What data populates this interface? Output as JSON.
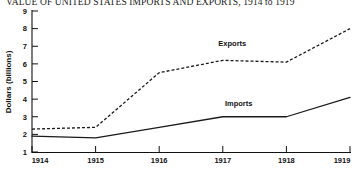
{
  "chart_data": {
    "type": "line",
    "title": "VALUE OF UNITED STATES IMPORTS AND EXPORTS, 1914 to 1919",
    "xlabel": "",
    "ylabel": "Dollars (billions)",
    "x": [
      1914,
      1915,
      1916,
      1917,
      1918,
      1919
    ],
    "x_tick_labels": [
      "1914",
      "1915",
      "1916",
      "1917",
      "1918",
      "1919"
    ],
    "y_tick_labels": [
      "1",
      "2",
      "3",
      "4",
      "5",
      "6",
      "7",
      "8",
      "9"
    ],
    "y_ticks": [
      1,
      2,
      3,
      4,
      5,
      6,
      7,
      8,
      9
    ],
    "xlim": [
      1914,
      1919
    ],
    "ylim": [
      1,
      9
    ],
    "grid": false,
    "legend": "inline-labels",
    "series": [
      {
        "name": "Exports",
        "style": "dashed",
        "color": "#1a1a1a",
        "values": [
          2.3,
          2.4,
          5.5,
          6.2,
          6.1,
          8.0
        ],
        "label_x": 1917.15,
        "label_y": 7.0
      },
      {
        "name": "Imports",
        "style": "solid",
        "color": "#1a1a1a",
        "values": [
          1.9,
          1.8,
          2.4,
          3.0,
          3.0,
          4.1
        ],
        "label_x": 1917.25,
        "label_y": 3.6
      }
    ]
  },
  "axes": {
    "y_axis_title": "Dollars (billions)"
  }
}
